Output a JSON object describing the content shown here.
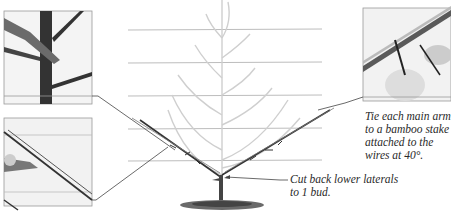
{
  "figure": {
    "partial_heading": "",
    "captions": {
      "right": {
        "lines": [
          "Tie each main arm",
          "to a bamboo stake",
          "attached to the",
          "wires at 40°."
        ]
      },
      "bottom": {
        "lines": [
          "Cut back lower laterals",
          "to 1 bud."
        ]
      }
    },
    "insets": [
      {
        "name": "pruning-cut-inset",
        "description": "secateurs cutting leader above lateral"
      },
      {
        "name": "bamboo-stake-tie-inset",
        "description": "hands tying arm to bamboo cane"
      },
      {
        "name": "arm-on-cane-inset",
        "description": "arm tied along diagonal cane"
      }
    ],
    "colors": {
      "ink": "#2a2a2a",
      "wire": "#b8b8b8",
      "faded_branch": "#c8c8c8",
      "frame": "#8a8a8a",
      "soil": "#555555"
    }
  }
}
